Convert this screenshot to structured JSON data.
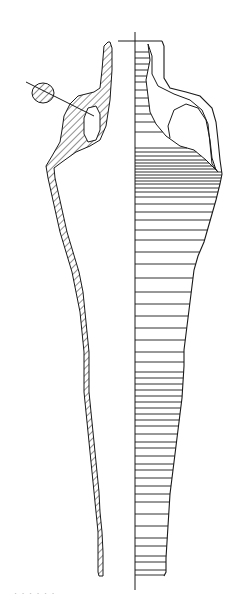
{
  "figure": {
    "style": {
      "ink": "#1a1a1a",
      "background": "#ffffff",
      "hatch_color": "#222222"
    },
    "axis": {
      "x": 135,
      "y_top": 32,
      "y_bottom": 590,
      "rim_line": {
        "x1": 118,
        "x2": 162,
        "y": 41
      }
    },
    "section_left": {
      "outer": [
        [
          108,
          42
        ],
        [
          104,
          46
        ],
        [
          102,
          70
        ],
        [
          100,
          88
        ],
        [
          94,
          92
        ],
        [
          78,
          96
        ],
        [
          70,
          104
        ],
        [
          64,
          116
        ],
        [
          62,
          130
        ],
        [
          60,
          142
        ],
        [
          52,
          156
        ],
        [
          46,
          166
        ],
        [
          48,
          178
        ],
        [
          52,
          196
        ],
        [
          56,
          214
        ],
        [
          60,
          232
        ],
        [
          66,
          252
        ],
        [
          72,
          272
        ],
        [
          76,
          292
        ],
        [
          80,
          312
        ],
        [
          82,
          332
        ],
        [
          84,
          352
        ],
        [
          84,
          372
        ],
        [
          84,
          392
        ],
        [
          86,
          412
        ],
        [
          88,
          432
        ],
        [
          90,
          452
        ],
        [
          92,
          472
        ],
        [
          94,
          492
        ],
        [
          96,
          512
        ],
        [
          98,
          532
        ],
        [
          98,
          552
        ],
        [
          98,
          572
        ],
        [
          99,
          576
        ]
      ],
      "inner": [
        [
          103,
          576
        ],
        [
          103,
          552
        ],
        [
          102,
          532
        ],
        [
          100,
          512
        ],
        [
          99,
          492
        ],
        [
          97,
          472
        ],
        [
          95,
          452
        ],
        [
          93,
          432
        ],
        [
          91,
          412
        ],
        [
          89,
          392
        ],
        [
          89,
          372
        ],
        [
          89,
          352
        ],
        [
          87,
          332
        ],
        [
          85,
          312
        ],
        [
          83,
          292
        ],
        [
          79,
          272
        ],
        [
          73,
          252
        ],
        [
          67,
          232
        ],
        [
          63,
          214
        ],
        [
          59,
          196
        ],
        [
          55,
          178
        ],
        [
          54,
          168
        ],
        [
          62,
          162
        ],
        [
          76,
          152
        ],
        [
          90,
          146
        ],
        [
          100,
          140
        ],
        [
          106,
          126
        ],
        [
          110,
          100
        ],
        [
          112,
          70
        ],
        [
          112,
          48
        ],
        [
          110,
          42
        ]
      ],
      "handle_opening": [
        [
          88,
          108
        ],
        [
          84,
          118
        ],
        [
          84,
          134
        ],
        [
          88,
          142
        ],
        [
          96,
          140
        ],
        [
          100,
          130
        ],
        [
          100,
          114
        ],
        [
          96,
          106
        ]
      ],
      "handle_section": {
        "cx": 43,
        "cy": 93,
        "rx": 11,
        "ry": 10
      },
      "handle_line": [
        [
          26,
          82
        ],
        [
          94,
          116
        ]
      ]
    },
    "profile_right": {
      "outline": [
        [
          162,
          41
        ],
        [
          164,
          46
        ],
        [
          164,
          78
        ],
        [
          170,
          88
        ],
        [
          186,
          92
        ],
        [
          200,
          96
        ],
        [
          212,
          108
        ],
        [
          216,
          122
        ],
        [
          218,
          140
        ],
        [
          220,
          160
        ],
        [
          222,
          174
        ],
        [
          220,
          184
        ],
        [
          216,
          200
        ],
        [
          212,
          214
        ],
        [
          208,
          228
        ],
        [
          204,
          242
        ],
        [
          198,
          256
        ],
        [
          194,
          270
        ],
        [
          192,
          286
        ],
        [
          190,
          302
        ],
        [
          188,
          318
        ],
        [
          186,
          334
        ],
        [
          184,
          350
        ],
        [
          184,
          366
        ],
        [
          183,
          382
        ],
        [
          182,
          398
        ],
        [
          180,
          414
        ],
        [
          178,
          430
        ],
        [
          176,
          446
        ],
        [
          174,
          462
        ],
        [
          172,
          478
        ],
        [
          170,
          494
        ],
        [
          169,
          510
        ],
        [
          168,
          526
        ],
        [
          167,
          542
        ],
        [
          166,
          558
        ],
        [
          166,
          572
        ],
        [
          164,
          576
        ]
      ],
      "inner_contour": [
        [
          148,
          44
        ],
        [
          152,
          56
        ],
        [
          152,
          74
        ],
        [
          158,
          86
        ],
        [
          174,
          94
        ],
        [
          190,
          100
        ],
        [
          202,
          110
        ],
        [
          208,
          124
        ],
        [
          210,
          144
        ],
        [
          212,
          164
        ],
        [
          218,
          172
        ]
      ],
      "neck_contour": [
        [
          148,
          44
        ],
        [
          150,
          60
        ],
        [
          148,
          70
        ],
        [
          146,
          80
        ],
        [
          148,
          96
        ],
        [
          150,
          112
        ],
        [
          156,
          124
        ],
        [
          166,
          136
        ],
        [
          180,
          146
        ],
        [
          194,
          150
        ],
        [
          206,
          160
        ],
        [
          218,
          172
        ]
      ],
      "handle_loop": [
        [
          170,
          138
        ],
        [
          168,
          126
        ],
        [
          174,
          110
        ],
        [
          186,
          104
        ],
        [
          198,
          108
        ],
        [
          206,
          120
        ],
        [
          210,
          140
        ],
        [
          212,
          158
        ],
        [
          216,
          170
        ]
      ],
      "ribs_y": [
        52,
        58,
        64,
        70,
        76,
        82,
        90,
        98,
        106,
        114,
        122,
        132,
        148,
        152,
        156,
        160,
        163,
        166,
        169,
        172,
        175,
        178,
        181,
        184,
        188,
        192,
        197,
        204,
        212,
        220,
        230,
        240,
        252,
        264,
        278,
        292,
        304,
        316,
        328,
        340,
        352,
        362,
        372,
        378,
        384,
        390,
        396,
        402,
        408,
        414,
        420,
        426,
        434,
        442,
        448,
        456,
        464,
        470,
        478,
        486,
        494,
        502,
        514,
        526,
        538,
        546,
        556,
        562,
        570,
        575
      ]
    },
    "caption_fragment": "· · · · · ·"
  }
}
